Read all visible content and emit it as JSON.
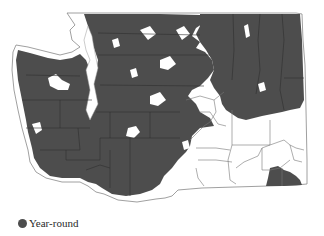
{
  "map": {
    "region": "Washington State",
    "shaded_fill": "#4d4d4d",
    "unshaded_fill": "#ffffff",
    "border_color": "#555555",
    "boundary_type": "county boundaries"
  },
  "legend": {
    "items": [
      {
        "label": "Year-round",
        "color": "#4d4d4d",
        "shape": "circle"
      }
    ]
  }
}
